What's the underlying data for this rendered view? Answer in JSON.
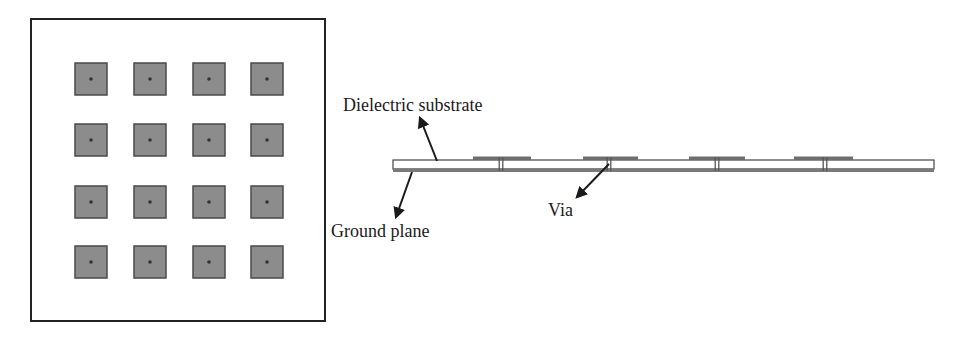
{
  "figure": {
    "top_view": {
      "title": "Top view of patch array",
      "rows": 4,
      "cols": 4,
      "box": {
        "x": 31,
        "y": 19,
        "w": 294,
        "h": 302
      },
      "patch_size": 32,
      "col_x": [
        75,
        134,
        193,
        251
      ],
      "row_y": [
        63,
        124,
        186,
        246
      ],
      "colors": {
        "patch_fill": "#8c8c8c",
        "patch_border": "#4a4a4a",
        "via_dot": "#333333",
        "frame": "#222222"
      }
    },
    "cross_section": {
      "substrate": {
        "x": 393,
        "y": 160,
        "w": 541,
        "h": 9,
        "fill": "#ffffff",
        "stroke": "#444444"
      },
      "ground_plane": {
        "x": 393,
        "y": 169,
        "w": 541,
        "h": 3,
        "fill": "#7a7a7a"
      },
      "patches": [
        {
          "x1": 473,
          "x2": 531,
          "via_x": 501
        },
        {
          "x1": 583,
          "x2": 638,
          "via_x": 609
        },
        {
          "x1": 689,
          "x2": 745,
          "via_x": 717
        },
        {
          "x1": 794,
          "x2": 853,
          "via_x": 825
        }
      ],
      "colors": {
        "patch": "#6e6e6e",
        "via": "#555555",
        "arrow": "#1a1a1a"
      }
    },
    "labels": {
      "dielectric_substrate": "Dielectric substrate",
      "ground_plane": "Ground plane",
      "via": "Via"
    }
  }
}
